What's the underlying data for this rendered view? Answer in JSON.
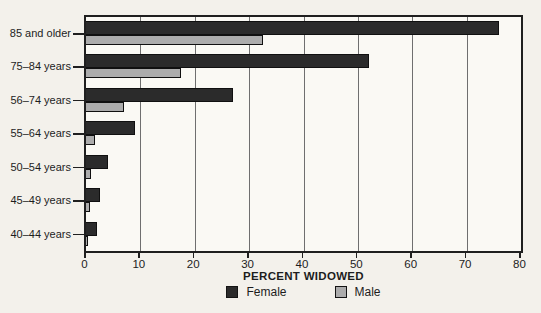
{
  "chart_data": {
    "type": "bar",
    "orientation": "horizontal",
    "title": "",
    "xlabel": "PERCENT WIDOWED",
    "ylabel": "",
    "xlim": [
      0,
      80
    ],
    "xticks": [
      0,
      10,
      20,
      30,
      40,
      50,
      60,
      70,
      80
    ],
    "grid": true,
    "legend_position": "bottom",
    "categories": [
      "85 and older",
      "75–84 years",
      "56–74 years",
      "55–64 years",
      "50–54 years",
      "45–49 years",
      "40–44 years"
    ],
    "series": [
      {
        "name": "Female",
        "color": "#2b2b2b",
        "values": [
          76,
          52,
          27,
          9,
          4,
          2.5,
          2
        ]
      },
      {
        "name": "Male",
        "color": "#acacac",
        "values": [
          32.5,
          17.5,
          7,
          1.6,
          0.9,
          0.7,
          0.4
        ]
      }
    ]
  },
  "colors": {
    "background": "#f3f1eb",
    "plot_background": "#faf9f4",
    "bar_border": "#101010",
    "grid_line": "#6f6f6f",
    "axis_border": "#1f1f1f",
    "text": "#1d1d1d"
  }
}
